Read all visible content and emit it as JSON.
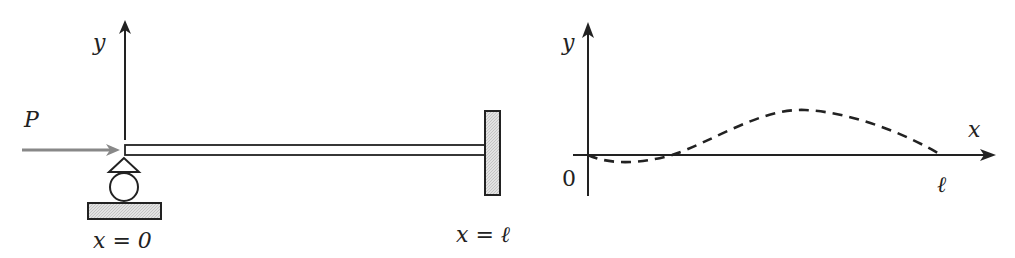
{
  "left_figure": {
    "y_axis_label": "y",
    "force_label": "P",
    "left_end_label": "x = 0",
    "right_end_label": "x = ℓ",
    "colors": {
      "force_arrow": "#888888",
      "ink": "#222222",
      "hatch_fill": "#d9d9d9"
    }
  },
  "right_figure": {
    "y_axis_label": "y",
    "x_axis_label": "x",
    "origin_label": "0",
    "end_label": "ℓ",
    "curve_style": "dashed"
  }
}
